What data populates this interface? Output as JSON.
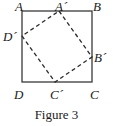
{
  "figure": {
    "caption": "Figure 3",
    "colors": {
      "stroke": "#3a3a3a",
      "dashed_stroke": "#2b2b2b",
      "text": "#1a1a1a",
      "background": "#ffffff"
    },
    "labels": {
      "outer_top_left": "A",
      "outer_top_right": "B",
      "outer_bottom_left": "D",
      "outer_bottom_right": "C",
      "inner_top": "A´",
      "inner_right": "B´",
      "inner_bottom": "C´",
      "inner_left": "D´"
    }
  },
  "chart_data": {
    "type": "diagram",
    "title": "Figure 3",
    "outer_square": {
      "name": "ABCD",
      "style": "solid",
      "vertices": [
        {
          "label": "A",
          "x": 22,
          "y": 11
        },
        {
          "label": "B",
          "x": 92,
          "y": 11
        },
        {
          "label": "C",
          "x": 92,
          "y": 82
        },
        {
          "label": "D",
          "x": 22,
          "y": 82
        }
      ]
    },
    "inner_square": {
      "name": "A'B'C'D'",
      "style": "dashed",
      "vertices": [
        {
          "label": "A´",
          "x": 59,
          "y": 11,
          "lies_on": "AB"
        },
        {
          "label": "B´",
          "x": 92,
          "y": 57,
          "lies_on": "BC"
        },
        {
          "label": "C´",
          "x": 55,
          "y": 82,
          "lies_on": "DC"
        },
        {
          "label": "D´",
          "x": 22,
          "y": 36,
          "lies_on": "AD"
        }
      ]
    }
  }
}
